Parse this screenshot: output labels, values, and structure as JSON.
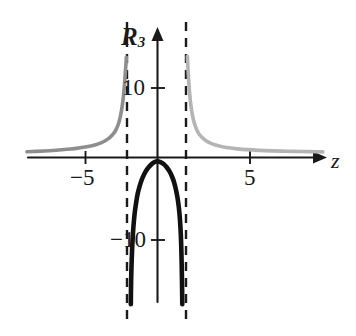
{
  "chart_data": {
    "type": "line",
    "title": "",
    "xlabel": "z",
    "ylabel": "R_3",
    "ylabel_base": "R",
    "ylabel_sub": "3",
    "xlim": [
      -9.0,
      11.4
    ],
    "ylim": [
      -19.5,
      13.5
    ],
    "grid": false,
    "legend": "none",
    "x_ticks": [
      -5,
      5
    ],
    "x_tick_labels": [
      "−5",
      "5"
    ],
    "y_ticks": [
      10,
      -10
    ],
    "y_tick_labels": [
      "10",
      "−10"
    ],
    "asymptotes": {
      "vertical": [
        -2.1,
        2.0
      ],
      "style": "dashed",
      "color": "#1a1a1a"
    },
    "series": [
      {
        "name": "left-outer-branch",
        "color": "#8e8e8e",
        "style": "solid",
        "x": [
          -9.0,
          -8.4,
          -7.8,
          -7.2,
          -6.6,
          -6.0,
          -5.5,
          -5.0,
          -4.6,
          -4.2,
          -3.9,
          -3.6,
          -3.3,
          -3.05,
          -2.85,
          -2.68,
          -2.55,
          -2.44,
          -2.36,
          -2.3,
          -2.25,
          -2.21,
          -2.18,
          -2.16,
          -2.15
        ],
        "y": [
          0.75,
          0.8,
          0.86,
          0.93,
          1.02,
          1.12,
          1.23,
          1.37,
          1.52,
          1.72,
          1.92,
          2.2,
          2.6,
          3.1,
          3.7,
          4.5,
          5.5,
          6.7,
          7.9,
          9.1,
          10.3,
          11.4,
          12.2,
          12.8,
          13.2
        ]
      },
      {
        "name": "right-outer-branch",
        "color": "#b4b4b4",
        "style": "solid",
        "x": [
          2.06,
          2.08,
          2.1,
          2.13,
          2.17,
          2.22,
          2.28,
          2.36,
          2.46,
          2.58,
          2.72,
          2.9,
          3.1,
          3.35,
          3.65,
          4.0,
          4.4,
          4.9,
          5.5,
          6.2,
          7.0,
          7.9,
          8.9,
          9.9,
          11.0,
          11.4
        ],
        "y": [
          13.3,
          12.6,
          11.8,
          10.8,
          9.6,
          8.4,
          7.2,
          6.1,
          5.1,
          4.3,
          3.6,
          3.0,
          2.6,
          2.2,
          1.9,
          1.65,
          1.45,
          1.28,
          1.14,
          1.03,
          0.94,
          0.87,
          0.82,
          0.78,
          0.75,
          0.74
        ]
      },
      {
        "name": "central-arch",
        "color": "#111111",
        "style": "solid",
        "x": [
          -1.84,
          -1.83,
          -1.81,
          -1.78,
          -1.74,
          -1.69,
          -1.63,
          -1.56,
          -1.47,
          -1.37,
          -1.25,
          -1.1,
          -0.92,
          -0.7,
          -0.45,
          -0.2,
          0.0,
          0.2,
          0.42,
          0.62,
          0.82,
          1.0,
          1.15,
          1.28,
          1.39,
          1.48,
          1.55,
          1.61,
          1.65,
          1.68,
          1.7,
          1.71
        ],
        "y": [
          -19.3,
          -17.5,
          -15.5,
          -13.5,
          -11.6,
          -9.9,
          -8.4,
          -7.1,
          -5.9,
          -4.8,
          -3.9,
          -3.0,
          -2.2,
          -1.5,
          -0.95,
          -0.6,
          -0.5,
          -0.6,
          -0.85,
          -1.25,
          -1.8,
          -2.5,
          -3.3,
          -4.3,
          -5.4,
          -6.7,
          -8.2,
          -10.2,
          -12.6,
          -15.3,
          -17.8,
          -19.3
        ]
      }
    ],
    "axis_arrows": {
      "x": "right",
      "y": "up"
    }
  },
  "labels": {
    "y_axis": "R",
    "y_axis_sub": "3",
    "x_axis": "z",
    "tick_y_positive": "10",
    "tick_y_negative": "−10",
    "tick_x_negative": "−5",
    "tick_x_positive": "5"
  },
  "colors": {
    "axis": "#1a1a1a",
    "gray_left": "#8e8e8e",
    "gray_right": "#b4b4b4",
    "black_curve": "#111111",
    "background": "#ffffff"
  }
}
